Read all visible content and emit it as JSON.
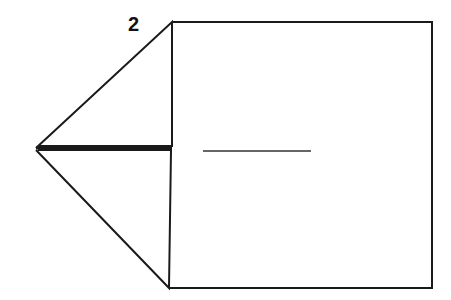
{
  "diagram": {
    "step_number": "2",
    "colors": {
      "line": "#1a1a1a",
      "background": "#ffffff"
    },
    "shapes": {
      "square": {
        "x1": 172,
        "y1": 22,
        "x2": 432,
        "y2": 288
      },
      "left_tip": {
        "x": 36,
        "y": 148
      },
      "upper_flap_corner": {
        "x": 172,
        "y": 22
      },
      "lower_flap_corner": {
        "x": 169,
        "y": 288
      },
      "center_crease": {
        "x1": 203,
        "y1": 151,
        "x2": 311,
        "y2": 151
      }
    }
  }
}
